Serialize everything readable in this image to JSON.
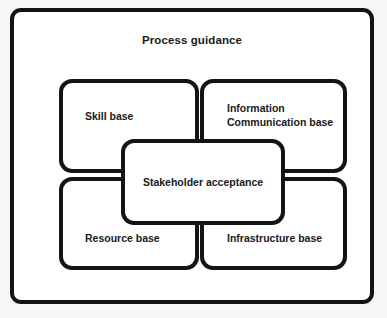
{
  "diagram": {
    "outer": {
      "title": "Process guidance"
    },
    "quadrants": [
      {
        "id": "skill-base",
        "label": "Skill base"
      },
      {
        "id": "information-communication-base",
        "label": "Information\nCommunication base"
      },
      {
        "id": "resource-base",
        "label": "Resource base"
      },
      {
        "id": "infrastructure-base",
        "label": "Infrastructure base"
      }
    ],
    "center": {
      "label": "Stakeholder acceptance"
    },
    "colors": {
      "stroke": "#141414",
      "text": "#1a1a1a",
      "fill": "#ffffff",
      "canvas": "#f7f7f7"
    }
  }
}
